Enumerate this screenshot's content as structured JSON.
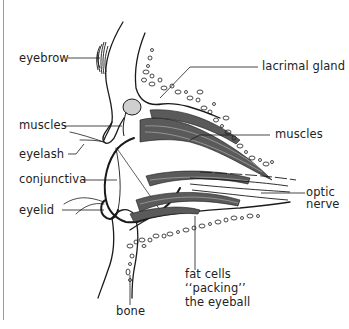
{
  "diagram": {
    "labels": {
      "eyebrow": "eyebrow",
      "lacrimal_gland": "lacrimal gland",
      "muscles_left": "muscles",
      "muscles_right": "muscles",
      "eyelash": "eyelash",
      "conjunctiva": "conjunctiva",
      "eyelid": "eyelid",
      "optic_nerve_line1": "optic",
      "optic_nerve_line2": "nerve",
      "fat_cells_line1": "fat cells",
      "fat_cells_line2": "‘‘packing’’",
      "fat_cells_line3": "the eyeball",
      "bone": "bone"
    },
    "colors": {
      "ink": "#1a1a1a",
      "muscle": "#555555",
      "background": "#ffffff",
      "frame": "#9a9a9a"
    }
  }
}
